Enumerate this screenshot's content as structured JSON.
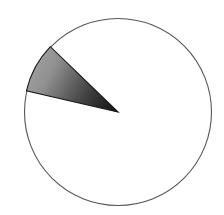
{
  "figure": {
    "name": "pie-chart-single-sector",
    "background_color": "#ffffff",
    "width": 224,
    "height": 215,
    "title": "",
    "caption": ""
  },
  "chart_data": {
    "type": "pie",
    "title": "",
    "subtitle": "",
    "xlabel": "",
    "ylabel": "",
    "legend": [],
    "legend_position": "none",
    "grid": false,
    "categories": [
      "Highlighted sector",
      "Remainder"
    ],
    "values": [
      8.6,
      91.4
    ],
    "value_unit": "percent",
    "labels_shown": false,
    "annotations": [],
    "geometry": {
      "center_x": 118,
      "center_y": 112,
      "radius": 94,
      "sector_start_angle_deg": 136,
      "sector_end_angle_deg": 167,
      "sector_sweep_deg": 31,
      "angle_convention": "counterclockwise from positive x-axis"
    },
    "slices": [
      {
        "name": "Highlighted sector",
        "value": 8.6,
        "start_angle_deg": 136,
        "end_angle_deg": 167,
        "fill_type": "linear-gradient",
        "fill_from": "#9d9d9d",
        "fill_to": "#131313",
        "stroke": "#1a1a1a",
        "stroke_width": 1
      },
      {
        "name": "Remainder",
        "value": 91.4,
        "start_angle_deg": 167,
        "end_angle_deg": 496,
        "fill_type": "solid",
        "fill_from": "#ffffff",
        "fill_to": "#ffffff",
        "stroke": "#555555",
        "stroke_width": 1
      }
    ]
  },
  "accessibility": {
    "chart_description": "Circle outlined in thin gray with a single narrow wedge shaded with a gradient from light gray at the arc to near black at the circle center, pointing from the upper left toward the center."
  }
}
